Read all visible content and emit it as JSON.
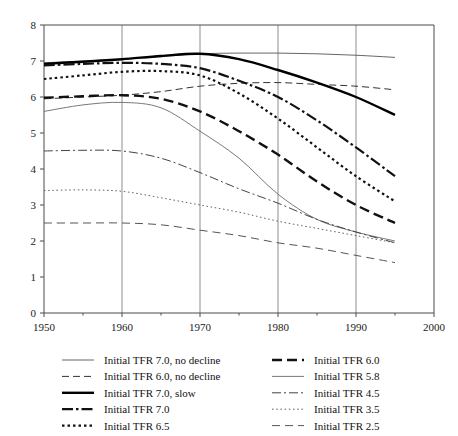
{
  "chart_data": {
    "type": "line",
    "title": "",
    "xlabel": "",
    "ylabel": "",
    "xlim": [
      1950,
      2000
    ],
    "ylim": [
      0,
      8
    ],
    "xticks": [
      1950,
      1960,
      1970,
      1980,
      1990,
      2000
    ],
    "yticks": [
      0,
      1,
      2,
      3,
      4,
      5,
      6,
      7,
      8
    ],
    "xtick_labels": [
      "1950",
      "1960",
      "1970",
      "1980",
      "1990",
      "2000"
    ],
    "ytick_labels": [
      "0",
      "1",
      "2",
      "3",
      "4",
      "5",
      "6",
      "7",
      "8"
    ],
    "grid": "vertical-at-xticks",
    "legend_position": "below-plot-two-columns",
    "x": [
      1950,
      1955,
      1960,
      1965,
      1970,
      1975,
      1980,
      1985,
      1990,
      1995
    ],
    "series": [
      {
        "name": "Initial TFR 7.0, no decline",
        "label": "Initial TFR 7.0, no decline",
        "style": "thin-solid",
        "color": "#555555",
        "width": 0.9,
        "dash": "none",
        "values": [
          6.95,
          7.0,
          7.05,
          7.12,
          7.2,
          7.22,
          7.22,
          7.2,
          7.16,
          7.1
        ]
      },
      {
        "name": "Initial TFR 6.0, no decline",
        "label": "Initial TFR 6.0, no decline",
        "style": "thin-dashed",
        "color": "#333333",
        "width": 1.0,
        "dash": "7,4",
        "values": [
          5.95,
          6.0,
          6.05,
          6.15,
          6.3,
          6.38,
          6.4,
          6.35,
          6.3,
          6.2
        ]
      },
      {
        "name": "Initial TFR 7.0, slow",
        "label": "Initial TFR 7.0, slow",
        "style": "thick-solid",
        "color": "#000000",
        "width": 2.4,
        "dash": "none",
        "values": [
          6.92,
          6.98,
          7.05,
          7.14,
          7.2,
          7.05,
          6.75,
          6.4,
          6.0,
          5.5
        ]
      },
      {
        "name": "Initial TFR 7.0",
        "label": "Initial TFR 7.0",
        "style": "thick-dash-dot",
        "color": "#111111",
        "width": 2.2,
        "dash": "11,3,2.5,3",
        "values": [
          6.88,
          6.92,
          6.95,
          6.92,
          6.8,
          6.45,
          6.0,
          5.35,
          4.6,
          3.8
        ]
      },
      {
        "name": "Initial TFR 6.5",
        "label": "Initial TFR 6.5",
        "style": "thick-dotted",
        "color": "#111111",
        "width": 2.2,
        "dash": "2.5,3",
        "values": [
          6.5,
          6.6,
          6.7,
          6.72,
          6.6,
          6.1,
          5.4,
          4.6,
          3.8,
          3.1
        ]
      },
      {
        "name": "Initial TFR 6.0",
        "label": "Initial TFR 6.0",
        "style": "thick-dashed",
        "color": "#111111",
        "width": 2.4,
        "dash": "10,5",
        "values": [
          5.98,
          6.02,
          6.05,
          5.95,
          5.6,
          5.05,
          4.4,
          3.65,
          3.0,
          2.5
        ]
      },
      {
        "name": "Initial TFR 5.8",
        "label": "Initial TFR 5.8",
        "style": "thin-solid",
        "color": "#6a6a6a",
        "width": 0.9,
        "dash": "none",
        "values": [
          5.6,
          5.78,
          5.85,
          5.7,
          5.05,
          4.3,
          3.3,
          2.6,
          2.25,
          2.0
        ]
      },
      {
        "name": "Initial TFR 4.5",
        "label": "Initial TFR 4.5",
        "style": "thin-dash-dot",
        "color": "#444444",
        "width": 1.0,
        "dash": "9,3,2,3",
        "values": [
          4.5,
          4.52,
          4.5,
          4.3,
          3.9,
          3.45,
          3.05,
          2.6,
          2.25,
          1.95
        ]
      },
      {
        "name": "Initial TFR 3.5",
        "label": "Initial TFR 3.5",
        "style": "thin-dotted",
        "color": "#666666",
        "width": 1.0,
        "dash": "1.6,2.6",
        "values": [
          3.4,
          3.42,
          3.38,
          3.2,
          3.0,
          2.8,
          2.55,
          2.35,
          2.15,
          1.95
        ]
      },
      {
        "name": "Initial TFR 2.5",
        "label": "Initial TFR 2.5",
        "style": "thin-dashed",
        "color": "#555555",
        "width": 1.0,
        "dash": "8,5",
        "values": [
          2.5,
          2.5,
          2.5,
          2.45,
          2.3,
          2.15,
          1.95,
          1.8,
          1.6,
          1.4
        ]
      }
    ],
    "legend": {
      "column_left": [
        "Initial TFR 7.0, no decline",
        "Initial TFR 6.0, no decline",
        "Initial TFR 7.0, slow",
        "Initial TFR 7.0",
        "Initial TFR 6.5"
      ],
      "column_right": [
        "Initial TFR 6.0",
        "Initial TFR 5.8",
        "Initial TFR 4.5",
        "Initial TFR 3.5",
        "Initial TFR 2.5"
      ]
    }
  }
}
